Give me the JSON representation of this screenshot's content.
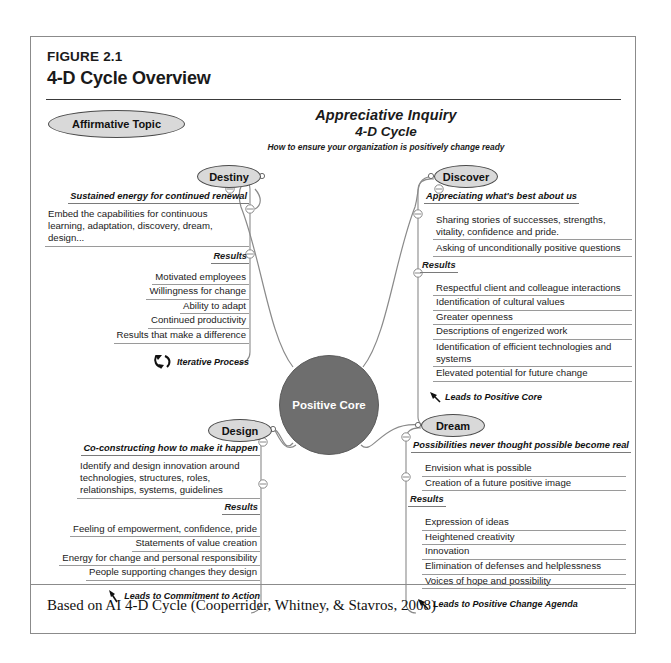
{
  "figure": {
    "label": "FIGURE 2.1",
    "title": "4-D Cycle Overview"
  },
  "affirmative_topic": "Affirmative Topic",
  "center_title": {
    "line1": "Appreciative Inquiry",
    "line2": "4-D Cycle",
    "subtitle": "How to ensure your organization is positively change ready"
  },
  "core": {
    "label": "Positive Core"
  },
  "colors": {
    "oval_fill": "#d9d9d9",
    "oval_stroke": "#4b4b4b",
    "core_fill": "#6e6e6e",
    "core_text": "#ffffff",
    "frame_border": "#8b8b8b",
    "rule": "#3a3a3a",
    "underline": "#9a9a9a"
  },
  "branches": {
    "destiny": {
      "node": "Destiny",
      "headline": "Sustained energy for continued renewal",
      "paragraph": "Embed the capabilities for continuous learning, adaptation, discovery, dream, design...",
      "results_label": "Results",
      "results": [
        "Motivated employees",
        "Willingness for change",
        "Ability to adapt",
        "Continued productivity",
        "Results that make a difference"
      ],
      "lead": "Iterative Process",
      "lead_icon": "iterative-cycle-icon"
    },
    "discover": {
      "node": "Discover",
      "headline": "Appreciating what's best about us",
      "items": [
        "Sharing stories of successes, strengths, vitality, confidence and pride.",
        "Asking of unconditionally positive questions"
      ],
      "results_label": "Results",
      "results": [
        "Respectful client and colleague interactions",
        "Identification of cultural values",
        "Greater openness",
        "Descriptions of engerized work",
        "Identification of efficient technologies and systems",
        "Elevated potential for future change"
      ],
      "lead": "Leads to Positive Core",
      "lead_icon": "arrow-up-left-icon"
    },
    "design": {
      "node": "Design",
      "headline": "Co-constructing how to make it happen",
      "paragraph": "Identify and design innovation around technologies, structures, roles, relationships, systems, guidelines",
      "results_label": "Results",
      "results": [
        "Feeling of empowerment, confidence, pride",
        "Statements of value creation",
        "Energy for change and personal responsibility",
        "People supporting changes they design"
      ],
      "lead": "Leads to Commitment to Action",
      "lead_icon": "arrow-up-left-icon"
    },
    "dream": {
      "node": "Dream",
      "headline": "Possibilities never thought possible become real",
      "items": [
        "Envision what is possible",
        "Creation of a future positive image"
      ],
      "results_label": "Results",
      "results": [
        "Expression of ideas",
        "Heightened creativity",
        "Innovation",
        "Elimination of defenses and helplessness",
        "Voices of hope and possibility"
      ],
      "lead": "Leads to Positive Change Agenda",
      "lead_icon": "arrow-up-left-icon"
    }
  },
  "caption": "Based on AI 4-D Cycle (Cooperrider, Whitney, & Stavros, 2008)"
}
